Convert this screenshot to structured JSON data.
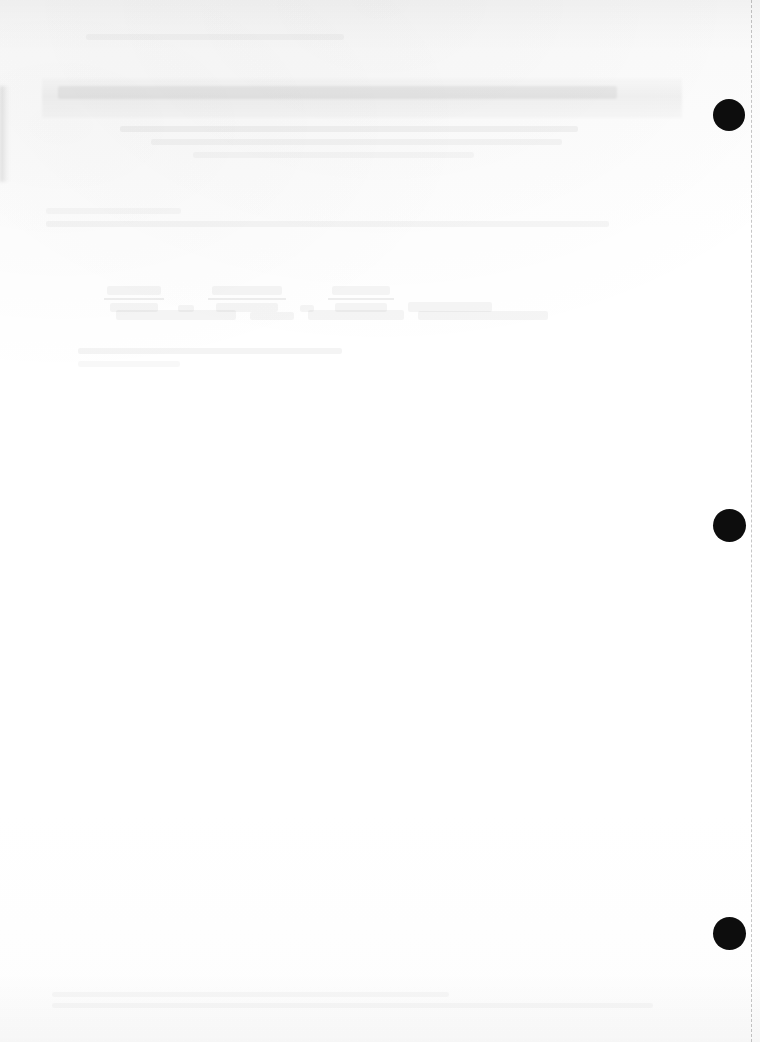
{
  "document": {
    "kind": "scanned-page",
    "legibility": "faded",
    "page_width": 760,
    "page_height": 1042,
    "background_color": "#ffffff",
    "paper_tone": "#fbfbfb",
    "ink_color": "#0d0d0d"
  },
  "artifacts": {
    "scan_band_top_label": "top scan shadow band",
    "smudge_band_label": "grey toner smudge band",
    "left_streak_label": "left edge scan streak",
    "bottom_shade_label": "bottom scan shadow",
    "dashed_rule_label": "right margin dashed rule",
    "dashed_rule_color": "#000000"
  },
  "punch_marks": [
    {
      "name": "punch-mark-top",
      "cx": 729,
      "cy": 115,
      "d": 32,
      "color": "#0d0d0d"
    },
    {
      "name": "punch-mark-middle",
      "cx": 729,
      "cy": 525,
      "d": 33,
      "color": "#0d0d0d"
    },
    {
      "name": "punch-mark-bottom",
      "cx": 729,
      "cy": 933,
      "d": 33,
      "color": "#0d0d0d"
    }
  ],
  "content": {
    "header_note": "",
    "title_line": "",
    "body_lines": [
      "",
      "",
      "",
      ""
    ],
    "formula_caption": "",
    "footer_lines": [
      "",
      ""
    ]
  },
  "content_regions": [
    {
      "name": "header-text-region",
      "label": "header text line (illegible)"
    },
    {
      "name": "title-region",
      "label": "title band (illegible)"
    },
    {
      "name": "subtitle-region",
      "label": "subtitle lines (illegible)"
    },
    {
      "name": "body-region",
      "label": "body paragraph lines (illegible)"
    },
    {
      "name": "formula-region",
      "label": "mathematical expressions (illegible)"
    },
    {
      "name": "caption-region",
      "label": "caption lines (illegible)"
    },
    {
      "name": "footer-region",
      "label": "footer text (illegible)"
    }
  ]
}
